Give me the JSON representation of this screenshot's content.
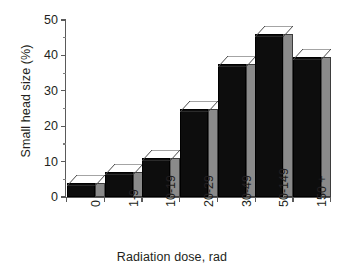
{
  "chart_data": {
    "type": "bar",
    "title": "",
    "xlabel": "Radiation dose, rad",
    "ylabel": "Small head size (%)",
    "categories": [
      "0",
      "1-9",
      "10-19",
      "20-29",
      "30-49",
      "50-149",
      "150 +"
    ],
    "values": [
      4,
      7,
      11,
      25,
      37.5,
      46,
      39.5
    ],
    "ylim": [
      0,
      50
    ],
    "yticks": [
      0,
      10,
      20,
      30,
      40,
      50
    ],
    "ytick_labels": [
      "0",
      "10",
      "20",
      "30",
      "40",
      "50"
    ],
    "yminor_ticks": [
      5,
      15,
      25,
      35,
      45
    ],
    "grid": false,
    "legend": false,
    "style": {
      "bar_front_color": "#0d0d0d",
      "bar_top_color": "#ffffff",
      "bar_side_color": "#8a8a8a",
      "axis_color": "#5a5a5a",
      "text_color": "#231f20",
      "background": "#ffffff",
      "three_d": true
    }
  }
}
